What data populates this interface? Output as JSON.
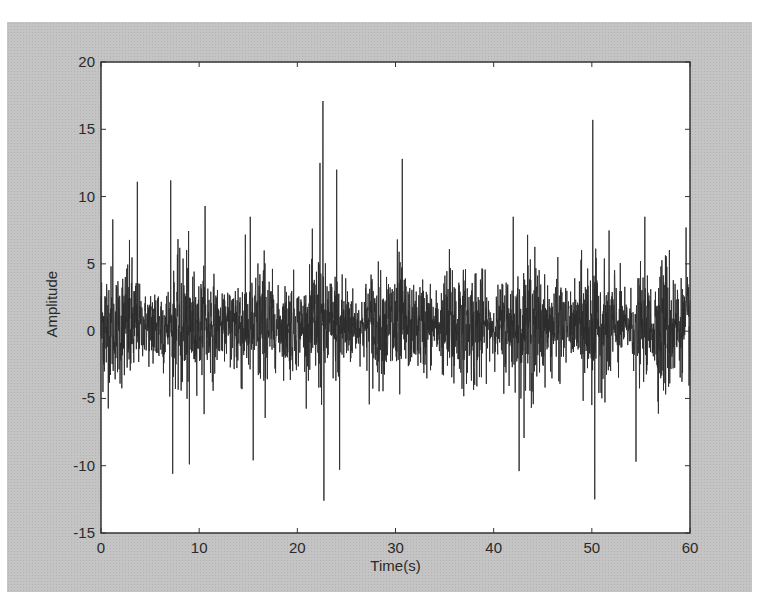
{
  "chart_data": {
    "type": "line",
    "title": "",
    "xlabel": "Time(s)",
    "ylabel": "Amplitude",
    "xlim": [
      0,
      60
    ],
    "ylim": [
      -15,
      20
    ],
    "xticks": [
      0,
      10,
      20,
      30,
      40,
      50,
      60
    ],
    "yticks": [
      -15,
      -10,
      -5,
      0,
      5,
      10,
      15,
      20
    ],
    "grid": false,
    "legend": null,
    "series": [
      {
        "name": "signal",
        "description": "dense noise-like time-domain vibration signal, bulk within approx -5 to +5",
        "observed_peaks": [
          {
            "t": 1.2,
            "value": 8.3
          },
          {
            "t": 3.7,
            "value": 11.1
          },
          {
            "t": 7.1,
            "value": 11.2
          },
          {
            "t": 10.6,
            "value": 9.3
          },
          {
            "t": 15.2,
            "value": 8.5
          },
          {
            "t": 22.3,
            "value": 12.5
          },
          {
            "t": 22.6,
            "value": 17.1
          },
          {
            "t": 24.0,
            "value": 12.0
          },
          {
            "t": 30.7,
            "value": 12.8
          },
          {
            "t": 42.0,
            "value": 8.5
          },
          {
            "t": 50.1,
            "value": 15.7
          },
          {
            "t": 55.4,
            "value": 8.5
          },
          {
            "t": 59.6,
            "value": 7.7
          }
        ],
        "observed_troughs": [
          {
            "t": 7.3,
            "value": -10.6
          },
          {
            "t": 9.0,
            "value": -9.9
          },
          {
            "t": 15.5,
            "value": -9.6
          },
          {
            "t": 22.7,
            "value": -12.6
          },
          {
            "t": 24.3,
            "value": -10.3
          },
          {
            "t": 42.6,
            "value": -10.4
          },
          {
            "t": 50.3,
            "value": -12.5
          },
          {
            "t": 54.5,
            "value": -9.7
          }
        ],
        "color": "#2b2b2b"
      }
    ]
  },
  "axes": {
    "x_tick_labels": [
      "0",
      "10",
      "20",
      "30",
      "40",
      "50",
      "60"
    ],
    "y_tick_labels": [
      "20",
      "15",
      "10",
      "5",
      "0",
      "-5",
      "-10",
      "-15"
    ]
  },
  "colors": {
    "figure_bg": "#c4c4c4",
    "plot_bg": "#ffffff",
    "line": "#2b2b2b",
    "axes": "#333333"
  }
}
